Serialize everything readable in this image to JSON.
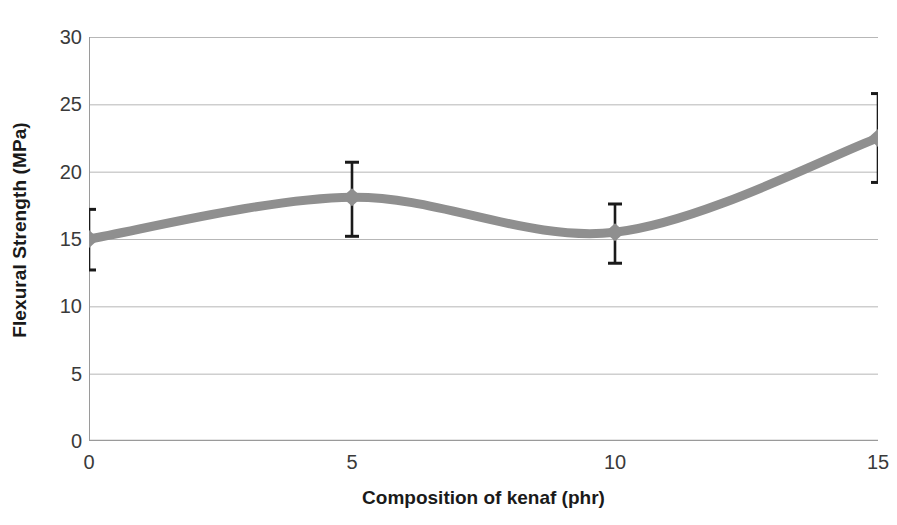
{
  "chart_data": {
    "type": "line",
    "title": "",
    "subtitle": "",
    "xlabel": "Composition of kenaf (phr)",
    "ylabel": "Flexural Strength (MPa)",
    "x": [
      0,
      5,
      10,
      15
    ],
    "values": [
      15.0,
      18.1,
      15.5,
      22.5
    ],
    "error_upper": [
      17.2,
      20.7,
      17.6,
      25.8
    ],
    "error_lower": [
      12.7,
      15.2,
      13.2,
      19.2
    ],
    "series": [
      {
        "name": "Flexural Strength",
        "values": [
          15.0,
          18.1,
          15.5,
          22.5
        ],
        "error_upper": [
          17.2,
          20.7,
          17.6,
          25.8
        ],
        "error_lower": [
          12.7,
          15.2,
          13.2,
          19.2
        ],
        "marker": "diamond",
        "smooth": true,
        "color": "#8f8f8f"
      }
    ],
    "xlim": [
      0,
      15
    ],
    "ylim": [
      0,
      30
    ],
    "x_ticks": [
      "0",
      "5",
      "10",
      "15"
    ],
    "x_tick_values": [
      0,
      5,
      10,
      15
    ],
    "y_ticks": [
      "0",
      "5",
      "10",
      "15",
      "20",
      "25",
      "30"
    ],
    "y_tick_values": [
      0,
      5,
      10,
      15,
      20,
      25,
      30
    ],
    "grid": {
      "horizontal": true,
      "vertical": false
    },
    "legend": {
      "visible": false,
      "position": "none",
      "entries": []
    },
    "annotations": [],
    "colors": {
      "line": "#8f8f8f",
      "marker": "#8f8f8f",
      "error_bar": "#1a1a1a",
      "grid": "#b7b7b7",
      "axis": "#9a9a9a",
      "tick_text": "#3a3a3a",
      "title_text": "#1a1a1a",
      "background": "#ffffff"
    }
  }
}
